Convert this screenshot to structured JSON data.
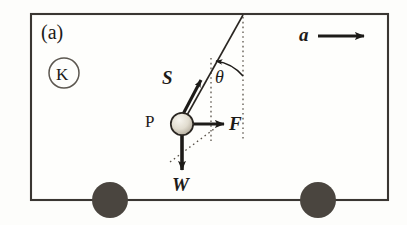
{
  "figure": {
    "panel_label": "(a)",
    "reference_frame_label": "K",
    "pendulum_bob_label": "P",
    "angle_label": "θ",
    "description_type": "free-body-diagram",
    "vectors": [
      {
        "id": "tension",
        "label": "S",
        "direction": "up-right",
        "meaning": "string tension"
      },
      {
        "id": "applied-force",
        "label": "F",
        "direction": "right",
        "meaning": "horizontal force"
      },
      {
        "id": "weight",
        "label": "W",
        "direction": "down",
        "meaning": "weight"
      },
      {
        "id": "acceleration",
        "label": "a",
        "direction": "right",
        "meaning": "box acceleration"
      }
    ],
    "colors": {
      "background": "#fdfdfb",
      "outline": "#3a3632",
      "ink": "#1d1b18",
      "wheel_fill": "#4a453f",
      "bob_light": "#f2efe6",
      "bob_dark": "#b9b2a4",
      "dotted": "#5a534a"
    },
    "geometry": {
      "box": {
        "x": 31,
        "y": 14,
        "width": 357,
        "height": 186
      },
      "pivot": {
        "x": 243,
        "y": 15
      },
      "bob": {
        "x": 182,
        "y": 124,
        "r": 11
      },
      "wheels": [
        {
          "cx": 110,
          "cy": 200,
          "r": 18
        },
        {
          "cx": 318,
          "cy": 200,
          "r": 18
        }
      ],
      "tension_tip": {
        "x": 201,
        "y": 78
      },
      "force_tip": {
        "x": 224,
        "y": 124
      },
      "weight_tip": {
        "x": 182,
        "y": 171
      },
      "accel_arrow": {
        "x1": 318,
        "y1": 36,
        "x2": 363,
        "y2": 36
      },
      "vertical_dotted_through_bob": {
        "x": 211,
        "y1": 60,
        "y2": 140
      },
      "vertical_dotted_through_pivot": {
        "x": 243,
        "y1": 18,
        "y2": 138
      }
    }
  }
}
